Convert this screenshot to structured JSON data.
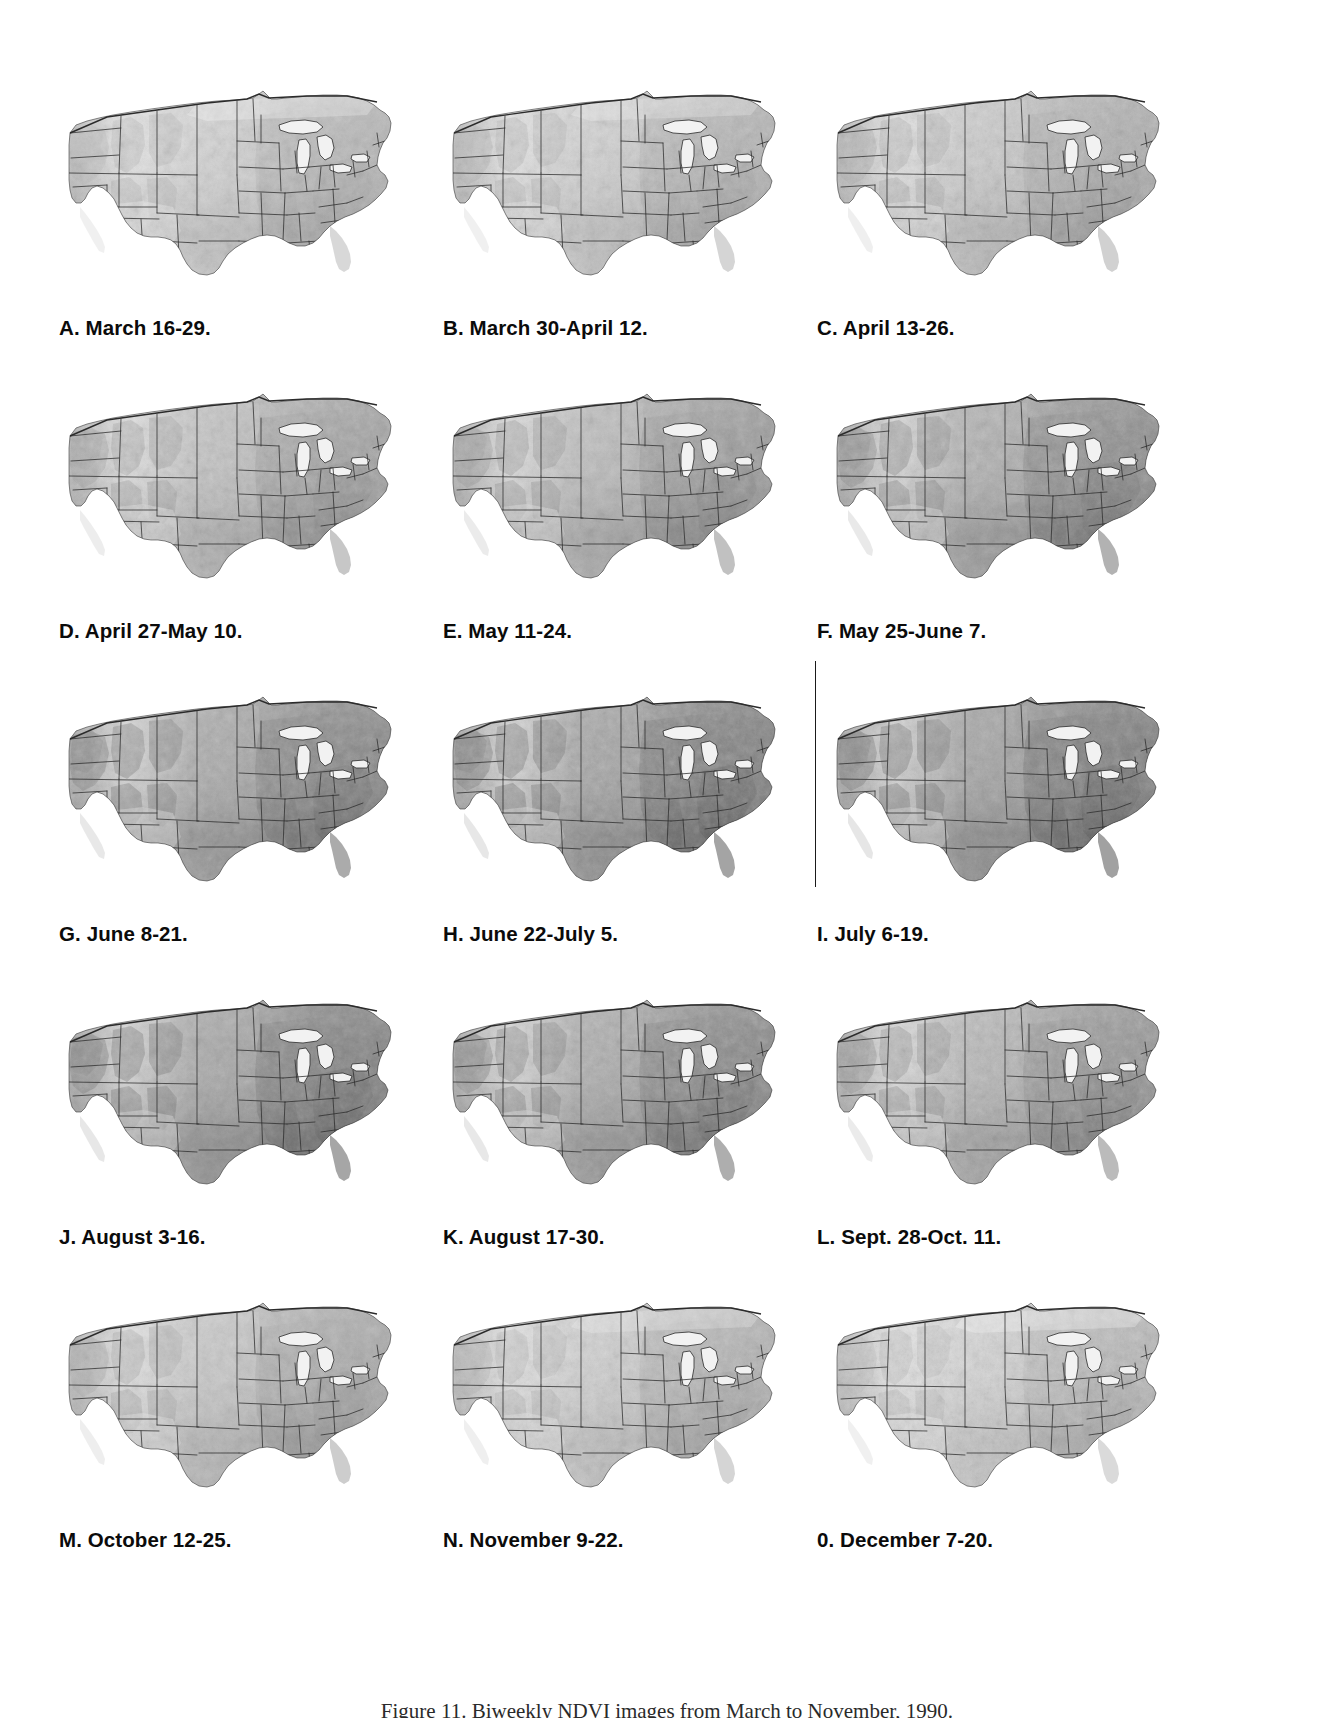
{
  "figure": {
    "caption": "Figure 11.  Biweekly NDVI images from March to November, 1990.",
    "region": "Conterminous United States",
    "rows": 5,
    "columns": 3
  },
  "panels": [
    {
      "id": "A",
      "label": "A. March 16-29.",
      "period": "March 16-29",
      "greenness": 0.3,
      "indent": 1,
      "left_rule": false
    },
    {
      "id": "B",
      "label": "B. March 30-April 12.",
      "period": "March 30-April 12",
      "greenness": 0.33,
      "indent": 1,
      "left_rule": false
    },
    {
      "id": "C",
      "label": "C. April 13-26.",
      "period": "April 13-26",
      "greenness": 0.38,
      "indent": 2,
      "left_rule": false
    },
    {
      "id": "D",
      "label": "D. April 27-May 10.",
      "period": "April 27-May 10",
      "greenness": 0.48,
      "indent": 1,
      "left_rule": false
    },
    {
      "id": "E",
      "label": "E. May 11-24.",
      "period": "May 11-24",
      "greenness": 0.55,
      "indent": 1,
      "left_rule": false
    },
    {
      "id": "F",
      "label": "F. May 25-June 7.",
      "period": "May 25-June 7",
      "greenness": 0.68,
      "indent": 2,
      "left_rule": false
    },
    {
      "id": "G",
      "label": "G. June 8-21.",
      "period": "June 8-21",
      "greenness": 0.74,
      "indent": 1,
      "left_rule": false
    },
    {
      "id": "H",
      "label": "H. June 22-July 5.",
      "period": "June 22-July 5",
      "greenness": 0.8,
      "indent": 1,
      "left_rule": false
    },
    {
      "id": "I",
      "label": "I. July 6-19.",
      "period": "July 6-19",
      "greenness": 0.82,
      "indent": 2,
      "left_rule": true
    },
    {
      "id": "J",
      "label": "J. August 3-16.",
      "period": "August 3-16",
      "greenness": 0.78,
      "indent": 1,
      "left_rule": false
    },
    {
      "id": "K",
      "label": "K. August 17-30.",
      "period": "August 17-30",
      "greenness": 0.72,
      "indent": 1,
      "left_rule": false
    },
    {
      "id": "L",
      "label": "L. Sept. 28-Oct. 11.",
      "period": "Sept. 28-Oct. 11",
      "greenness": 0.6,
      "indent": 2,
      "left_rule": false
    },
    {
      "id": "M",
      "label": "M. October 12-25.",
      "period": "October 12-25",
      "greenness": 0.42,
      "indent": 1,
      "left_rule": false
    },
    {
      "id": "N",
      "label": "N. November 9-22.",
      "period": "November 9-22",
      "greenness": 0.34,
      "indent": 1,
      "left_rule": false
    },
    {
      "id": "O",
      "label": "0. December 7-20.",
      "period": "December 7-20",
      "greenness": 0.28,
      "indent": 2,
      "left_rule": false
    }
  ],
  "colors": {
    "page_background": "#ffffff",
    "caption_text": "#0b0b0b",
    "figure_caption_text": "#2a2a2a",
    "boundary_line": "#2b2b2b",
    "lake_fill": "#f2f2f2",
    "land_light": "#e2e2e2",
    "land_dark": "#6f6f6f"
  },
  "chart_data": {
    "type": "heatmap",
    "title": "Biweekly NDVI images from March to November, 1990.",
    "xlabel": "",
    "ylabel": "",
    "categories": [
      "March 16-29",
      "March 30-April 12",
      "April 13-26",
      "April 27-May 10",
      "May 11-24",
      "May 25-June 7",
      "June 8-21",
      "June 22-July 5",
      "July 6-19",
      "August 3-16",
      "August 17-30",
      "Sept. 28-Oct. 11",
      "October 12-25",
      "November 9-22",
      "December 7-20"
    ],
    "values": [
      0.3,
      0.33,
      0.38,
      0.48,
      0.55,
      0.68,
      0.74,
      0.8,
      0.82,
      0.78,
      0.72,
      0.6,
      0.42,
      0.34,
      0.28
    ],
    "legend": [],
    "grid": false
  }
}
